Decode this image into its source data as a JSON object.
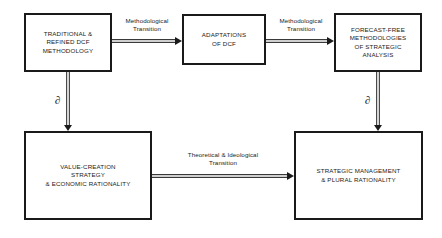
{
  "diagram": {
    "background_color": "#ffffff",
    "line_color": "#1a1a1a",
    "nodes": [
      {
        "id": "dcf",
        "label": "TRADITIONAL &\nREFINED DCF\nMETHODOLOGY"
      },
      {
        "id": "adapt",
        "label": "ADAPTATIONS\nOF DCF"
      },
      {
        "id": "forecast",
        "label": "FORECAST-FREE\nMETHODOLOGIES\nOF STRATEGIC\nANALYSIS"
      },
      {
        "id": "value",
        "label": "VALUE-CREATION\nSTRATEGY\n& ECONOMIC RATIONALITY"
      },
      {
        "id": "strategic",
        "label": "STRATEGIC MANAGEMENT\n& PLURAL RATIONALITY"
      }
    ],
    "edges": [
      {
        "id": "meth-1",
        "from": "dcf",
        "to": "adapt",
        "label": "Methodological\nTransition",
        "direction": "right"
      },
      {
        "id": "meth-2",
        "from": "adapt",
        "to": "forecast",
        "label": "Methodological\nTransition",
        "direction": "right"
      },
      {
        "id": "theo",
        "from": "value",
        "to": "strategic",
        "label": "Theoretical & Ideological\nTransition",
        "direction": "right"
      },
      {
        "id": "down-left",
        "from": "dcf",
        "to": "value",
        "label": "∂",
        "direction": "down"
      },
      {
        "id": "down-right",
        "from": "forecast",
        "to": "strategic",
        "label": "∂",
        "direction": "down"
      }
    ]
  }
}
